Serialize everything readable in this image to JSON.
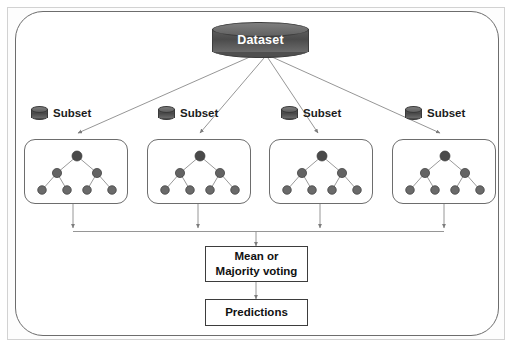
{
  "diagram": {
    "title_fragment": "",
    "root": {
      "label": "Dataset",
      "icon": "database-cylinder-icon",
      "fill": "#4f4f4f",
      "text_color": "#ffffff"
    },
    "subsets": [
      {
        "label": "Subset",
        "icon": "database-cylinder-icon"
      },
      {
        "label": "Subset",
        "icon": "database-cylinder-icon"
      },
      {
        "label": "Subset",
        "icon": "database-cylinder-icon"
      },
      {
        "label": "Subset",
        "icon": "database-cylinder-icon"
      }
    ],
    "trees": [
      {
        "name": "decision-tree-1",
        "nodes": 7,
        "depth": 3
      },
      {
        "name": "decision-tree-2",
        "nodes": 7,
        "depth": 3
      },
      {
        "name": "decision-tree-3",
        "nodes": 7,
        "depth": 3
      },
      {
        "name": "decision-tree-4",
        "nodes": 7,
        "depth": 3
      }
    ],
    "aggregate_box": {
      "line1": "Mean or",
      "line2": "Majority voting"
    },
    "output_box": {
      "label": "Predictions"
    },
    "colors": {
      "cylinder_dark": "#4f4f4f",
      "node_root": "#4a4a4a",
      "node_leaf": "#6a6a6a",
      "connector": "#8a8a8a",
      "box_border": "#6d6d6d",
      "proc_border": "#3d3d3d",
      "frame_border": "#d2d2d2",
      "background": "#ffffff"
    }
  }
}
